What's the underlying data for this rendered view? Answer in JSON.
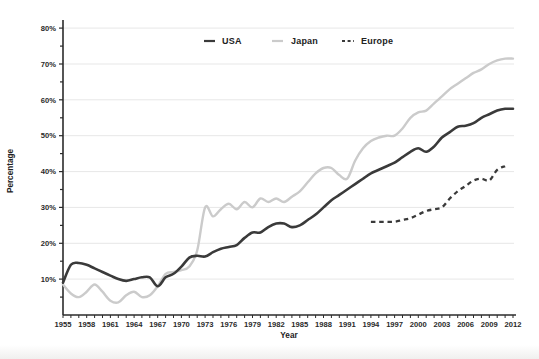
{
  "chart_data": {
    "type": "line",
    "title": "",
    "xlabel": "Year",
    "ylabel": "Percentage",
    "xlim": [
      1955,
      2012
    ],
    "ylim": [
      0,
      80
    ],
    "xticks": [
      1955,
      1958,
      1961,
      1964,
      1967,
      1970,
      1973,
      1976,
      1979,
      1982,
      1985,
      1988,
      1991,
      1994,
      1997,
      2000,
      2003,
      2006,
      2009,
      2012
    ],
    "yticks": [
      10,
      20,
      30,
      40,
      50,
      60,
      70,
      80
    ],
    "ytick_suffix": "%",
    "grid": true,
    "gridcolor": "#e7e7e7",
    "axis_color": "#2b2b2b",
    "legend_position": "top-center-inside",
    "series": [
      {
        "name": "Japan",
        "color": "#cbcbcb",
        "dash": "solid",
        "x_start": 1955,
        "values": [
          8.5,
          6,
          5,
          6.5,
          8.5,
          6.5,
          4,
          3.5,
          5.5,
          6.5,
          5,
          5.5,
          8,
          11.5,
          12,
          12.5,
          13.5,
          18,
          30,
          27.5,
          29.5,
          31,
          29.5,
          31.5,
          30,
          32.5,
          31.5,
          32.5,
          31.5,
          33,
          34.5,
          37,
          39.5,
          41,
          41,
          39,
          38,
          43,
          46.5,
          48.5,
          49.5,
          50,
          50,
          52,
          55,
          56.5,
          57,
          59,
          61,
          63,
          64.5,
          66,
          67.5,
          68.5,
          70,
          71,
          71.5,
          71.5
        ]
      },
      {
        "name": "USA",
        "color": "#3a3a3a",
        "dash": "solid",
        "x_start": 1955,
        "values": [
          9,
          14,
          14.5,
          14,
          13,
          12,
          11,
          10,
          9.5,
          10,
          10.5,
          10.5,
          8,
          10.5,
          11.5,
          13.5,
          16,
          16.5,
          16.3,
          17.5,
          18.5,
          19,
          19.5,
          21.5,
          23,
          23,
          24.5,
          25.5,
          25.5,
          24.5,
          25,
          26.5,
          28,
          30,
          32,
          33.5,
          35,
          36.5,
          38,
          39.5,
          40.5,
          41.5,
          42.5,
          44,
          45.5,
          46.5,
          45.5,
          47,
          49.5,
          51,
          52.5,
          52.8,
          53.5,
          55,
          56,
          57,
          57.5,
          57.5
        ]
      },
      {
        "name": "Europe",
        "color": "#3a3a3a",
        "dash": "dashed",
        "x_start": 1994,
        "values": [
          26,
          26,
          26,
          26,
          26.5,
          27,
          28,
          29,
          29.5,
          30,
          32.5,
          34.5,
          36,
          37.5,
          38,
          37.5,
          40.5,
          41.5
        ]
      }
    ]
  },
  "legend": {
    "items": [
      {
        "label": "USA"
      },
      {
        "label": "Japan"
      },
      {
        "label": "Europe"
      }
    ]
  }
}
